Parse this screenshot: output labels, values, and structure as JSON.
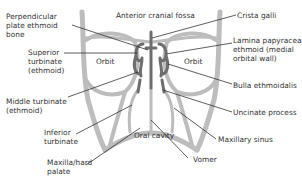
{
  "diagram": {
    "colors": {
      "bone": "#bdbdbd",
      "turbinate": "#6e6e6e",
      "leader": "#333333",
      "text": "#333333"
    },
    "labels": {
      "perpendicular_plate": "Perpendicular\nplate ethmoid\nbone",
      "anterior_cranial_fossa": "Anterior cranial fossa",
      "crista_galli": "Crista galli",
      "lamina_papyracea": "Lamina papyracea\nethmoid (medial\norbital wall)",
      "superior_turbinate": "Superior\nturbinate\n(ethmoid)",
      "orbit_left": "Orbit",
      "orbit_right": "Orbit",
      "bulla_ethmoidalis": "Bulla ethmoidalis",
      "middle_turbinate": "Middle turbinate\n(ethmoid)",
      "uncinate_process": "Uncinate process",
      "inferior_turbinate": "Inferior\nturbinate",
      "oral_cavity": "Oral cavity",
      "maxillary_sinus": "Maxillary sinus",
      "vomer": "Vomer",
      "maxilla_hard_palate": "Maxilla/hard\npalate"
    }
  }
}
